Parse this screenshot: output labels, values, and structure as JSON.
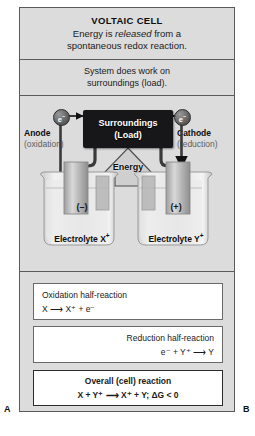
{
  "figure": {
    "corner_label_left": "A",
    "corner_label_right": "B"
  },
  "header": {
    "title": "VOLTAIC CELL",
    "line1_pre": "Energy is ",
    "line1_em": "released",
    "line1_post": " from a",
    "line2": "spontaneous redox reaction."
  },
  "work_band": {
    "line1": "System does work on",
    "line2": "surroundings (load)."
  },
  "circuit": {
    "surroundings_line1": "Surroundings",
    "surroundings_line2": "(Load)",
    "energy_label": "Energy",
    "electron_left": "e",
    "electron_left_sup": "−",
    "electron_right": "e",
    "electron_right_sup": "−",
    "anode_name": "Anode",
    "anode_sub": "(oxidation)",
    "cathode_name": "Cathode",
    "cathode_sub": "(reduction)"
  },
  "cell": {
    "left_charge": "(–)",
    "right_charge": "(+)",
    "left_electrolyte": "Electrolyte X",
    "left_electrolyte_sup": "+",
    "right_electrolyte": "Electrolyte Y",
    "right_electrolyte_sup": "+"
  },
  "reactions": {
    "oxidation_title": "Oxidation half-reaction",
    "oxidation_eq": "X ⟶ X⁺ + e⁻",
    "reduction_title": "Reduction half-reaction",
    "reduction_eq": "e⁻ + Y⁺ ⟶ Y",
    "overall_title": "Overall (cell) reaction",
    "overall_eq": "X + Y⁺ ⟶ X⁺ + Y;  ΔG < 0"
  },
  "colors": {
    "panel_background": "#dcdcdc",
    "frame_border": "#5a5a5a",
    "surroundings_box": "#17171a",
    "box_background": "#ffffff",
    "text_primary": "#1a1a1a",
    "text_muted": "#5e5e5e"
  }
}
